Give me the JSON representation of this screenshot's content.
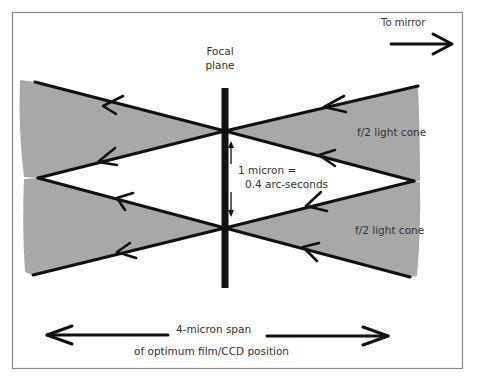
{
  "diagram": {
    "colors": {
      "frame": "#8a8a8a",
      "cone_fill": "#a8a8a8",
      "ray_line": "#111111",
      "text": "#333333",
      "background": "#ffffff"
    },
    "labels": {
      "to_mirror": "To mirror",
      "focal_plane_line1": "Focal",
      "focal_plane_line2": "plane",
      "micron_line1": "1 micron =",
      "micron_line2": "0.4 arc-seconds",
      "cone_upper": "f/2 light cone",
      "cone_lower": "f/2 light cone",
      "span_line1": "4-micron span",
      "span_line2": "of optimum film/CCD position"
    },
    "icons": {
      "mirror_arrow": "arrow-right",
      "span_left_arrow": "arrow-left",
      "span_right_arrow": "arrow-right",
      "micron_arrow": "double-arrow-vertical",
      "ray_arrowheads": "arrow-left"
    }
  }
}
